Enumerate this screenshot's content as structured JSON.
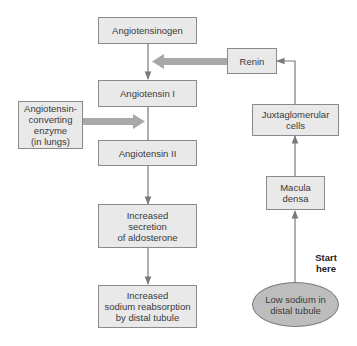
{
  "diagram": {
    "type": "flowchart",
    "nodes": {
      "angiotensinogen": "Angiotensinogen",
      "renin": "Renin",
      "angiotensin_1": "Angiotensin I",
      "ace": "Angiotensin-\nconverting\nenzyme\n(in lungs)",
      "angiotensin_2": "Angiotensin II",
      "aldosterone": "Increased\nsecretion\nof aldosterone",
      "sodium_reabsorption": "Increased\nsodium reabsorption\nby distal tubule",
      "juxtaglomerular": "Juxtaglomerular\ncells",
      "macula_densa": "Macula\ndensa",
      "low_sodium": "Low sodium in\ndistal tubule"
    },
    "start_label": "Start\nhere",
    "edges": [
      {
        "from": "low_sodium",
        "to": "macula_densa",
        "style": "thin"
      },
      {
        "from": "macula_densa",
        "to": "juxtaglomerular",
        "style": "thin"
      },
      {
        "from": "juxtaglomerular",
        "to": "renin",
        "style": "thin"
      },
      {
        "from": "renin",
        "to": "angiotensinogen_to_angiotensin_1_edge",
        "style": "thick"
      },
      {
        "from": "angiotensinogen",
        "to": "angiotensin_1",
        "style": "thin"
      },
      {
        "from": "ace",
        "to": "angiotensin_1_to_angiotensin_2_edge",
        "style": "thick"
      },
      {
        "from": "angiotensin_1",
        "to": "angiotensin_2",
        "style": "thin"
      },
      {
        "from": "angiotensin_2",
        "to": "aldosterone",
        "style": "thin"
      },
      {
        "from": "aldosterone",
        "to": "sodium_reabsorption",
        "style": "thin"
      }
    ],
    "colors": {
      "box_fill": "#e9e9e9",
      "box_border": "#8a8a8a",
      "ellipse_fill": "#bdbdbd",
      "thin_arrow": "#7a7a7a",
      "thick_arrow": "#a8a8a8"
    }
  }
}
